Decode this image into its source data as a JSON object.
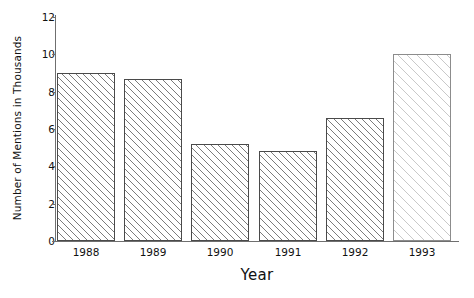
{
  "chart_data": {
    "type": "bar",
    "title": "",
    "xlabel": "Year",
    "ylabel": "Number of Mentions in Thousands",
    "categories": [
      "1988",
      "1989",
      "1990",
      "1991",
      "1992",
      "1993"
    ],
    "values": [
      9.0,
      8.7,
      5.2,
      4.8,
      6.6,
      10.0
    ],
    "series": [
      {
        "name": "Number of Mentions in Thousands",
        "values": [
          9.0,
          8.7,
          5.2,
          4.8,
          6.6,
          10.0
        ]
      }
    ],
    "ylim": [
      0,
      12
    ],
    "yticks": [
      0,
      2,
      4,
      6,
      8,
      10,
      12
    ],
    "ytick_labels": [
      "0",
      "2",
      "4",
      "6",
      "8",
      "10",
      "12"
    ],
    "grid": false,
    "legend": false,
    "legend_position": "none",
    "bar_styles": [
      "hatched-dark",
      "hatched-dark",
      "hatched-dark",
      "hatched-dark",
      "hatched-dark",
      "hatched-light"
    ],
    "colors": {
      "background": "#ffffff",
      "bar_fill": "#ffffff",
      "bar_hatch": "#7b7b7b",
      "bar_hatch_light": "#c9c9c9",
      "bar_outline": "#4a4a4a",
      "axis": "#6f6f6f",
      "text": "#111111"
    }
  }
}
